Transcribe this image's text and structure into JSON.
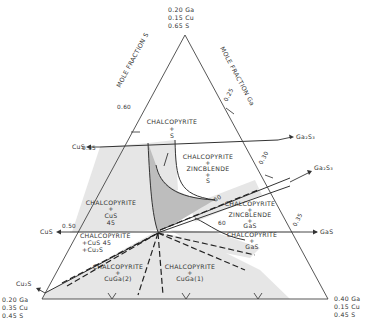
{
  "diagram": {
    "vertices": {
      "top": [
        "0.20 Ga",
        "0.15 Cu",
        "0.65 S"
      ],
      "bottom_left": [
        "0.20 Ga",
        "0.35 Cu",
        "0.45 S"
      ],
      "bottom_right": [
        "0.40 Ga",
        "0.15 Cu",
        "0.45 S"
      ]
    },
    "axes": {
      "left": "MOLE FRACTION S",
      "right": "MOLE FRACTION Ga"
    },
    "ticks": {
      "s_060": "0.60",
      "s_055": "0.55",
      "s_050": "0.50",
      "ga_025": "0.25",
      "ga_030": "0.30",
      "ga_035": "0.35"
    },
    "phase_arrows": {
      "cus_upper": "CuS",
      "cus_lower": "CuS",
      "cu2s": "Cu₂S",
      "ga2s3_upper": "Ga₂S₃",
      "ga2s3_lower": "Ga₂S₃",
      "gas": "GaS"
    },
    "regions": {
      "chalco_s": [
        "CHALCOPYRITE",
        "+",
        "S"
      ],
      "chalco_zinc_s": [
        "CHALCOPYRITE",
        "+",
        "ZINCBLENDE",
        "+",
        "S"
      ],
      "chalco_cus": [
        "CHALCOPYRITE",
        "+",
        "CuS",
        "45"
      ],
      "chalco_zinc_gas": [
        "CHALCOPYRITE",
        "+",
        "ZINCBLENDE",
        "+",
        "GaS"
      ],
      "chalco_gas": [
        "CHALCOPYRITE",
        "+",
        "GaS"
      ],
      "chalco_cus_cu2s": [
        "CHALCOPYRITE",
        "+CuS  45",
        "+Cu₂S"
      ],
      "chalco_cuga2": [
        "CHALCOPYRITE",
        "+",
        "CuGa(2)"
      ],
      "chalco_cuga1": [
        "CHALCOPYRITE",
        "+",
        "CuGa(1)"
      ]
    },
    "contour_labels": {
      "c60_upper": "60",
      "c60_lower": "60",
      "c45_left": "45"
    }
  }
}
